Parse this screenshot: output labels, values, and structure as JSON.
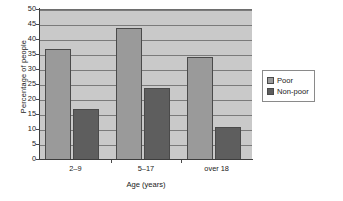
{
  "chart_data": {
    "type": "bar",
    "title": "",
    "subtitle": "",
    "xlabel": "Age (years)",
    "ylabel": "Percentage of people",
    "categories": [
      "2–9",
      "5–17",
      "over 18"
    ],
    "series": [
      {
        "name": "Poor",
        "values": [
          37,
          44,
          34.5
        ],
        "color": "#9a9a9a"
      },
      {
        "name": "Non-poor",
        "values": [
          17,
          24,
          11
        ],
        "color": "#5e5e5e"
      }
    ],
    "ylim": [
      0,
      50
    ],
    "ytick_step": 5,
    "ytick_labels": [
      "0",
      "5",
      "10",
      "15",
      "20",
      "25",
      "30",
      "35",
      "40",
      "45",
      "50"
    ],
    "grid": true,
    "grid_axis": "y",
    "legend_position": "right",
    "plot_background": "#c9c9c9",
    "figure_background": "#ffffff"
  },
  "legend": {
    "entries": [
      {
        "label": "Poor"
      },
      {
        "label": "Non-poor"
      }
    ]
  }
}
